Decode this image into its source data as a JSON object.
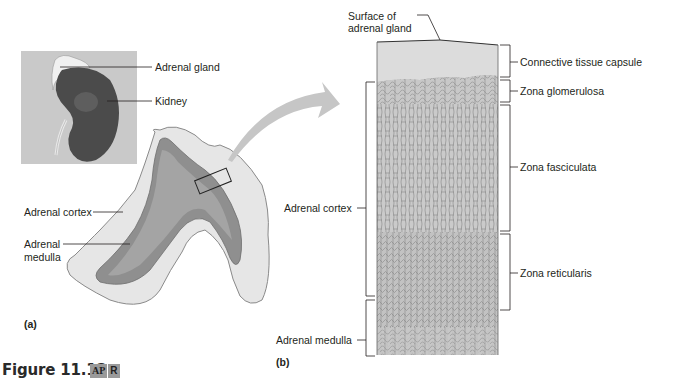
{
  "figure": {
    "caption": "Figure 11.13",
    "badge": {
      "left": "AP",
      "right": "R"
    }
  },
  "panel_a": {
    "letter": "(a)",
    "labels": {
      "adrenal_gland": "Adrenal gland",
      "kidney": "Kidney",
      "adrenal_cortex": "Adrenal cortex",
      "adrenal_medulla_line1": "Adrenal",
      "adrenal_medulla_line2": "medulla"
    }
  },
  "panel_b": {
    "letter": "(b)",
    "labels": {
      "surface_line1": "Surface of",
      "surface_line2": "adrenal gland",
      "adrenal_cortex": "Adrenal cortex",
      "adrenal_medulla": "Adrenal medulla",
      "connective_tissue_capsule": "Connective tissue capsule",
      "zona_glomerulosa": "Zona glomerulosa",
      "zona_fasciculata": "Zona fasciculata",
      "zona_reticularis": "Zona reticularis"
    }
  },
  "colors": {
    "inset_bg": "#c9c9c9",
    "kidney": "#4a4a4a",
    "gland_cortex": "#e4e4e4",
    "gland_medulla": "#8e8e8e",
    "tissue_capsule": "#d9d9d9",
    "tissue": "#bdbdbd",
    "arrow": "#c4c4c4"
  }
}
